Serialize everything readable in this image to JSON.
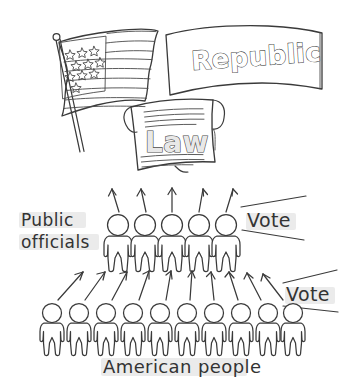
{
  "illustration": {
    "title": "Republic civics diagram",
    "style": "hand-drawn black and white line art sketch",
    "background_color": "#ffffff",
    "ink_color": "#3a3a3a",
    "highlight_color": "#ebebeb"
  },
  "banner": {
    "text": "Republic",
    "icon": "ribbon-banner-icon",
    "lettering": "outlined bubble letters"
  },
  "flag": {
    "icon": "american-flag-icon",
    "stars": 10,
    "stripes": 7,
    "has_pole": true,
    "pole_finial": "ball"
  },
  "document": {
    "text": "Law",
    "icon": "law-scroll-icon",
    "lettering": "outlined bubble letters",
    "text_lines_above": 4,
    "text_lines_below": 4,
    "curled_corner": true
  },
  "officials": {
    "label": "Public officials",
    "count": 5,
    "arrow_count": 5,
    "vote_label": "Vote"
  },
  "people": {
    "label": "American people",
    "count": 10,
    "arrow_count": 10,
    "vote_label": "Vote"
  },
  "labels": {
    "public_officials": "Public officials",
    "american_people": "American people",
    "vote_upper": "Vote",
    "vote_lower": "Vote"
  }
}
